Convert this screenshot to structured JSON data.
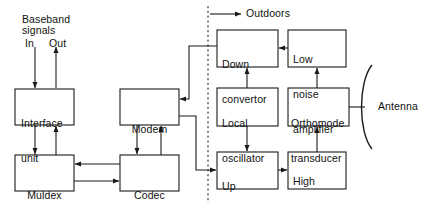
{
  "diagram": {
    "annotations": {
      "baseband_line1": "Baseband",
      "baseband_line2": "signals",
      "in_label": "In",
      "out_label": "Out",
      "outdoors_label": "Outdoors",
      "antenna_label": "Antenna"
    },
    "blocks": [
      {
        "id": "interface-unit",
        "line1": "Interface",
        "line2": "unit",
        "x": 15,
        "y": 89,
        "w": 59,
        "h": 36
      },
      {
        "id": "muldex",
        "line1": "Muldex",
        "line2": "",
        "x": 15,
        "y": 155,
        "w": 59,
        "h": 36
      },
      {
        "id": "modem",
        "line1": "Modem",
        "line2": "",
        "x": 120,
        "y": 89,
        "w": 59,
        "h": 36
      },
      {
        "id": "codec",
        "line1": "Codec",
        "line2": "",
        "x": 120,
        "y": 155,
        "w": 59,
        "h": 36
      },
      {
        "id": "down-convertor",
        "line1": "Down",
        "line2": "convertor",
        "x": 217,
        "y": 30,
        "w": 61,
        "h": 37
      },
      {
        "id": "low-noise-amplifier",
        "line1": "Low",
        "line2": "noise",
        "line3": "amplifier",
        "x": 288,
        "y": 30,
        "w": 58,
        "h": 37
      },
      {
        "id": "local-oscillator",
        "line1": "Local",
        "line2": "oscillator",
        "x": 217,
        "y": 88,
        "w": 61,
        "h": 38
      },
      {
        "id": "orthomode-transducer",
        "line1": "Orthomode",
        "line2": "transducer",
        "x": 288,
        "y": 88,
        "w": 61,
        "h": 38
      },
      {
        "id": "up-convertor",
        "line1": "Up",
        "line2": "convertor",
        "x": 217,
        "y": 152,
        "w": 61,
        "h": 37
      },
      {
        "id": "high-power-amplifier",
        "line1": "High",
        "line2": "power",
        "line3": "amplifier",
        "x": 288,
        "y": 152,
        "w": 58,
        "h": 37
      }
    ],
    "colors": {
      "stroke": "#1a1a1a",
      "background": "#ffffff",
      "text": "#111111"
    }
  }
}
